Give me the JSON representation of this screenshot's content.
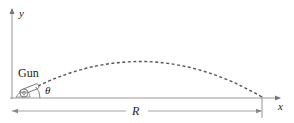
{
  "diagram": {
    "type": "projectile-trajectory",
    "axes": {
      "x_label": "x",
      "y_label": "y"
    },
    "labels": {
      "gun": "Gun",
      "angle": "θ",
      "range": "R"
    },
    "colors": {
      "line": "#888888",
      "trajectory": "#555555",
      "text": "#222222"
    }
  }
}
